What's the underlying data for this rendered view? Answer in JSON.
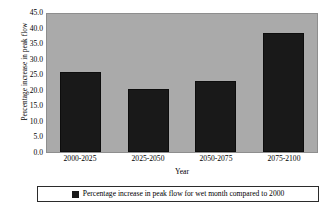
{
  "chart_data": {
    "type": "bar",
    "title": "",
    "subtitle": "",
    "categories": [
      "2000-2025",
      "2025-2050",
      "2050-2075",
      "2075-2100"
    ],
    "values": [
      25.7,
      20.3,
      22.7,
      38.4
    ],
    "series": [
      {
        "name": "Percentage increase in peak flow for wet month compared to 2000",
        "values": [
          25.7,
          20.3,
          22.7,
          38.4
        ]
      }
    ],
    "xlabel": "Year",
    "ylabel": "Percentage increase in peak flow",
    "ylim": [
      0.0,
      45.0
    ],
    "ytick_labels": [
      "45.0",
      "40.0",
      "35.0",
      "30.0",
      "25.0",
      "20.0",
      "15.0",
      "10.0",
      "5.0",
      "0.0"
    ],
    "ytick_values": [
      45.0,
      40.0,
      35.0,
      30.0,
      25.0,
      20.0,
      15.0,
      10.0,
      5.0,
      0.0
    ],
    "grid": false,
    "legend_position": "bottom",
    "legend_entries": [
      "Percentage increase in peak flow for wet month compared to 2000"
    ],
    "colors": {
      "bar": "#191919",
      "plot_background": "#aaaaaa",
      "page_background": "#ffffff",
      "axis_text": "#000000",
      "legend_border": "#2b2b2b"
    }
  }
}
